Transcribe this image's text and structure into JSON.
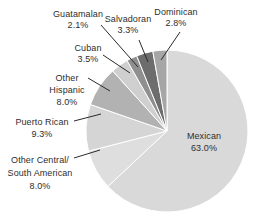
{
  "chart_data": {
    "type": "pie",
    "title": "",
    "unit": "percent",
    "direction": "clockwise",
    "start_angle": "12 o'clock",
    "legend_position": "callout-labels",
    "total": 100.0,
    "slices": [
      {
        "label": "Mexican",
        "lines": [
          "Mexican"
        ],
        "value": 63.0,
        "display": "63.0%",
        "color": "#d9d9d9"
      },
      {
        "label": "Other Central/South American",
        "lines": [
          "Other Central/",
          "South American"
        ],
        "value": 8.0,
        "display": "8.0%",
        "color": "#dedede"
      },
      {
        "label": "Puerto Rican",
        "lines": [
          "Puerto Rican"
        ],
        "value": 9.3,
        "display": "9.3%",
        "color": "#d5d5d5"
      },
      {
        "label": "Other Hispanic",
        "lines": [
          "Other",
          "Hispanic"
        ],
        "value": 8.0,
        "display": "8.0%",
        "color": "#b2b2b2"
      },
      {
        "label": "Cuban",
        "lines": [
          "Cuban"
        ],
        "value": 3.5,
        "display": "3.5%",
        "color": "#cfcfcf"
      },
      {
        "label": "Guatamalan",
        "lines": [
          "Guatamalan"
        ],
        "value": 2.1,
        "display": "2.1%",
        "color": "#8f8f8f"
      },
      {
        "label": "Salvadoran",
        "lines": [
          "Salvadoran"
        ],
        "value": 3.3,
        "display": "3.3%",
        "color": "#6d6d6d"
      },
      {
        "label": "Dominican",
        "lines": [
          "Dominican"
        ],
        "value": 2.8,
        "display": "2.8%",
        "color": "#a6a6a6"
      }
    ]
  }
}
